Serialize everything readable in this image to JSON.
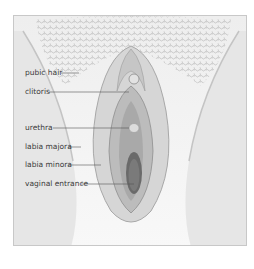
{
  "figure": {
    "type": "anatomical-illustration",
    "style": "grayscale",
    "labels": [
      {
        "id": "pubic-hair",
        "text": "pubic hair"
      },
      {
        "id": "clitoris",
        "text": "clitoris"
      },
      {
        "id": "urethra",
        "text": "urethra"
      },
      {
        "id": "labia-majora",
        "text": "labia majora"
      },
      {
        "id": "labia-minora",
        "text": "labia minora"
      },
      {
        "id": "vaginal-entrance",
        "text": "vaginal entrance"
      }
    ]
  },
  "colors": {
    "frame_border": "#c8c8c8",
    "background": "#f6f6f6",
    "label_text": "#3a3a3a",
    "leader_line": "#555555"
  }
}
